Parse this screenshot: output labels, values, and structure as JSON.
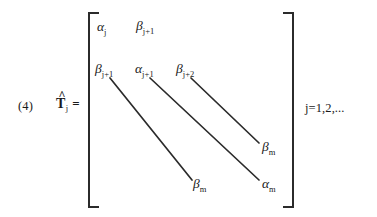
{
  "equation": {
    "number_label": "(4)",
    "lhs": {
      "symbol": "T",
      "accent": "hat-accent",
      "subscript": "j",
      "relation": "="
    },
    "index_range": "j=1,2,...",
    "matrix": {
      "bracket_style": "square",
      "entries": [
        {
          "id": "alpha-j",
          "letter": "α",
          "subscript": "j"
        },
        {
          "id": "beta-j-plus-1-row1",
          "letter": "β",
          "subscript": "j+1"
        },
        {
          "id": "beta-j-plus-1-row2",
          "letter": "β",
          "subscript": "j+1"
        },
        {
          "id": "alpha-j-plus-1",
          "letter": "α",
          "subscript": "j+1"
        },
        {
          "id": "beta-j-plus-2",
          "letter": "β",
          "subscript": "j+2"
        },
        {
          "id": "beta-m-upper",
          "letter": "β",
          "subscript": "m"
        },
        {
          "id": "beta-m-lower",
          "letter": "β",
          "subscript": "m"
        },
        {
          "id": "alpha-m",
          "letter": "α",
          "subscript": "m"
        }
      ],
      "ellipsis_diagonals": [
        {
          "id": "diagonal-lower",
          "x1": 110,
          "y1": 78,
          "x2": 192,
          "y2": 180
        },
        {
          "id": "diagonal-middle",
          "x1": 150,
          "y1": 78,
          "x2": 259,
          "y2": 180
        },
        {
          "id": "diagonal-upper",
          "x1": 191,
          "y1": 78,
          "x2": 259,
          "y2": 143
        }
      ]
    }
  },
  "style": {
    "ink_color": "#1a1a1a",
    "rule_color": "#2b2b2b",
    "page_background": "#ffffff"
  }
}
